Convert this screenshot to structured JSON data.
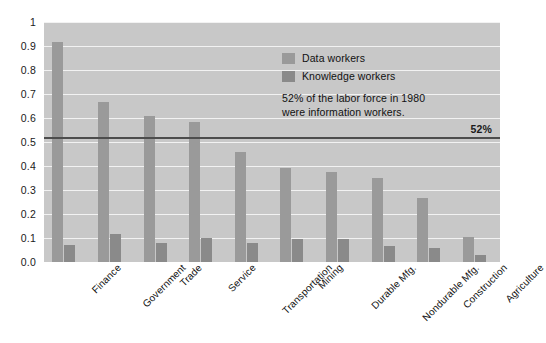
{
  "chart_data": {
    "type": "bar",
    "title": "",
    "xlabel": "",
    "ylabel": "",
    "ylim": [
      0,
      1
    ],
    "grid": true,
    "legend_position": "inside-top-center",
    "categories": [
      "Finance",
      "Government",
      "Trade",
      "Service",
      "Transportation",
      "Mining",
      "Durable Mfg.",
      "Nondurable Mfg.",
      "Construction",
      "Agriculture"
    ],
    "ytick_labels": [
      "0.0",
      "0.1",
      "0.2",
      "0.3",
      "0.4",
      "0.5",
      "0.6",
      "0.7",
      "0.8",
      "0.9",
      "1"
    ],
    "ytick_values": [
      0,
      0.1,
      0.2,
      0.3,
      0.4,
      0.5,
      0.6,
      0.7,
      0.8,
      0.9,
      1
    ],
    "series": [
      {
        "name": "Data workers",
        "color": "#9a9a9a",
        "values": [
          0.915,
          0.665,
          0.61,
          0.585,
          0.46,
          0.39,
          0.375,
          0.35,
          0.265,
          0.105
        ]
      },
      {
        "name": "Knowledge workers",
        "color": "#8a8a8a",
        "values": [
          0.07,
          0.115,
          0.08,
          0.1,
          0.08,
          0.095,
          0.095,
          0.065,
          0.06,
          0.03
        ]
      }
    ],
    "reference_line": {
      "value": 0.52,
      "label": "52%",
      "color": "#4d4d4d"
    },
    "annotation": {
      "line1": "52% of the labor force in 1980",
      "line2": "were information workers."
    },
    "plot_background": "#c8c8c8",
    "gridline_color": "#f2f2f2"
  }
}
